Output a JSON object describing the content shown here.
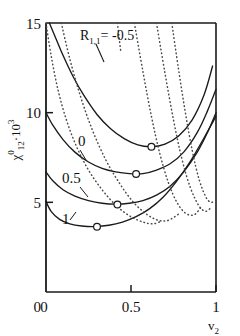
{
  "chart_data": {
    "type": "line",
    "title": "",
    "subtitle": "",
    "xlabel": "v_2",
    "xlabel_base": "v",
    "xlabel_sub": "2",
    "ylabel": "chi^0_12 * 10^3",
    "ylabel_base": "χ",
    "ylabel_sup": "0",
    "ylabel_sub": "12",
    "ylabel_factor": "·10",
    "ylabel_factor_exp": "3",
    "xlim": [
      0,
      1
    ],
    "ylim": [
      0,
      15
    ],
    "xticks": [
      0,
      0.5,
      1
    ],
    "xticklabels": [
      "0",
      "0.5",
      "1"
    ],
    "yticks": [
      0,
      5,
      10,
      15
    ],
    "yticklabels": [
      "0",
      "5",
      "10",
      "15"
    ],
    "grid": false,
    "legend": "inline-curve-labels",
    "annotation": {
      "text_r": "R",
      "text_sub": "1,1",
      "text_eq": "= -0.5"
    },
    "marker_style": "open-circle",
    "marker_note": "open circles mark the minimum of each solid curve",
    "series": [
      {
        "name": "R = -0.5 (solid)",
        "label": "-0.5",
        "style": "solid",
        "x": [
          0.02,
          0.06,
          0.1,
          0.16,
          0.22,
          0.3,
          0.38,
          0.46,
          0.54,
          0.62,
          0.7,
          0.78,
          0.86,
          0.93,
          0.98
        ],
        "y": [
          15.0,
          14.1,
          13.2,
          12.0,
          11.0,
          9.9,
          9.1,
          8.55,
          8.2,
          8.1,
          8.25,
          8.7,
          9.6,
          11.0,
          12.6
        ],
        "minimum": {
          "x": 0.62,
          "y": 8.1
        }
      },
      {
        "name": "R = 0 (solid)",
        "label": "0",
        "style": "solid",
        "x": [
          0.0,
          0.04,
          0.1,
          0.17,
          0.25,
          0.33,
          0.41,
          0.49,
          0.57,
          0.65,
          0.73,
          0.81,
          0.89,
          0.95,
          1.0
        ],
        "y": [
          10.0,
          9.3,
          8.5,
          7.8,
          7.25,
          6.9,
          6.7,
          6.6,
          6.6,
          6.8,
          7.15,
          7.8,
          8.9,
          10.1,
          11.3
        ],
        "minimum": {
          "x": 0.53,
          "y": 6.58
        }
      },
      {
        "name": "R = 0.5 (solid)",
        "label": "0.5",
        "style": "solid",
        "x": [
          0.0,
          0.04,
          0.1,
          0.17,
          0.25,
          0.33,
          0.41,
          0.49,
          0.57,
          0.65,
          0.73,
          0.81,
          0.89,
          0.95,
          1.0
        ],
        "y": [
          6.7,
          6.2,
          5.7,
          5.35,
          5.1,
          4.95,
          4.9,
          4.95,
          5.1,
          5.4,
          5.9,
          6.7,
          7.8,
          8.9,
          10.0
        ],
        "minimum": {
          "x": 0.42,
          "y": 4.88
        }
      },
      {
        "name": "R = 1 (solid)",
        "label": "1",
        "style": "solid",
        "x": [
          0.0,
          0.03,
          0.08,
          0.14,
          0.21,
          0.29,
          0.37,
          0.45,
          0.53,
          0.61,
          0.69,
          0.77,
          0.85,
          0.93,
          1.0
        ],
        "y": [
          5.05,
          4.5,
          4.05,
          3.8,
          3.68,
          3.65,
          3.72,
          3.9,
          4.2,
          4.65,
          5.3,
          6.2,
          7.3,
          8.6,
          9.8
        ],
        "minimum": {
          "x": 0.3,
          "y": 3.64
        }
      },
      {
        "name": "dotted branch 1",
        "label": "",
        "style": "dotted",
        "x": [
          0.0,
          0.03,
          0.07,
          0.12,
          0.18,
          0.25,
          0.33,
          0.41,
          0.49,
          0.57,
          0.63,
          0.68
        ],
        "y": [
          15.0,
          13.2,
          11.3,
          9.6,
          8.1,
          6.8,
          5.7,
          4.85,
          4.25,
          3.9,
          3.8,
          3.95
        ]
      },
      {
        "name": "dotted branch 2",
        "label": "",
        "style": "dotted",
        "x": [
          0.09,
          0.14,
          0.2,
          0.27,
          0.35,
          0.43,
          0.51,
          0.59,
          0.66,
          0.72,
          0.78
        ],
        "y": [
          15.0,
          13.0,
          11.0,
          9.1,
          7.4,
          6.1,
          5.05,
          4.35,
          4.0,
          4.0,
          4.35
        ]
      },
      {
        "name": "dotted branch 3",
        "label": "",
        "style": "dotted",
        "x": [
          0.52,
          0.57,
          0.62,
          0.67,
          0.72,
          0.77,
          0.82,
          0.87,
          0.91
        ],
        "y": [
          15.0,
          12.3,
          9.8,
          7.7,
          6.1,
          5.0,
          4.4,
          4.3,
          4.7
        ]
      },
      {
        "name": "dotted branch 4",
        "label": "",
        "style": "dotted",
        "x": [
          0.65,
          0.7,
          0.75,
          0.8,
          0.85,
          0.9,
          0.94,
          0.97
        ],
        "y": [
          15.0,
          12.2,
          9.6,
          7.4,
          5.8,
          4.8,
          4.5,
          4.7
        ]
      },
      {
        "name": "dotted branch 5",
        "label": "",
        "style": "dotted",
        "x": [
          0.74,
          0.78,
          0.82,
          0.86,
          0.9,
          0.94,
          0.97,
          0.99
        ],
        "y": [
          15.0,
          12.4,
          10.0,
          7.9,
          6.3,
          5.3,
          5.0,
          5.1
        ]
      },
      {
        "name": "dotted branch annotation leader",
        "label": "",
        "style": "dotted-short",
        "x": [
          0.42,
          0.43,
          0.44
        ],
        "y": [
          15.0,
          14.2,
          13.4
        ]
      }
    ],
    "markers": [
      {
        "x": 0.62,
        "y": 8.1
      },
      {
        "x": 0.53,
        "y": 6.58
      },
      {
        "x": 0.42,
        "y": 4.88
      },
      {
        "x": 0.3,
        "y": 3.64
      }
    ],
    "colors": {
      "axis": "#1a1a1a",
      "solid_curve": "#1a1a1a",
      "dotted_curve": "#4a4a4a",
      "marker_fill": "#ffffff",
      "background": "#ffffff"
    }
  }
}
